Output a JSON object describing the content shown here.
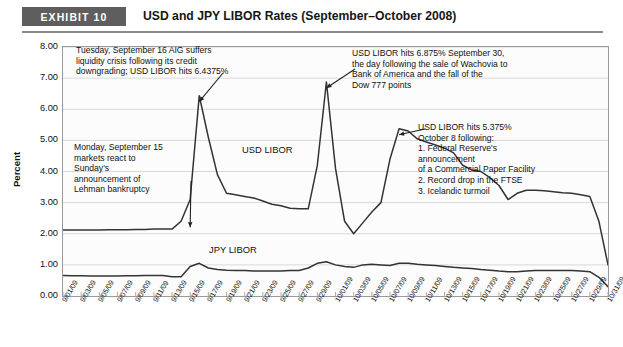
{
  "header": {
    "badge": "EXHIBIT 10",
    "title": "USD and JPY LIBOR Rates (September–October 2008)"
  },
  "chart_data": {
    "type": "line",
    "title": "USD and JPY LIBOR Rates (September–October 2008)",
    "xlabel": "",
    "ylabel": "Percent",
    "ylim": [
      0.0,
      8.0
    ],
    "ytick_labels": [
      "0.00",
      "1.00",
      "2.00",
      "3.00",
      "4.00",
      "5.00",
      "6.00",
      "7.00",
      "8.00"
    ],
    "ytick_values": [
      0,
      1,
      2,
      3,
      4,
      5,
      6,
      7,
      8
    ],
    "grid": true,
    "legend_position": "inline-plot-labels",
    "x": [
      "9/01/09",
      "9/02/09",
      "9/03/09",
      "9/04/09",
      "9/05/09",
      "9/06/09",
      "9/07/09",
      "9/08/09",
      "9/09/09",
      "9/10/09",
      "9/11/09",
      "9/12/09",
      "9/13/09",
      "9/14/09",
      "9/15/09",
      "9/16/09",
      "9/17/09",
      "9/18/09",
      "9/19/09",
      "9/20/09",
      "9/21/09",
      "9/22/09",
      "9/23/09",
      "9/24/09",
      "9/25/09",
      "9/26/09",
      "9/27/09",
      "9/28/09",
      "9/29/09",
      "9/30/09",
      "10/01/09",
      "10/02/09",
      "10/03/09",
      "10/04/09",
      "10/05/09",
      "10/06/09",
      "10/07/09",
      "10/08/09",
      "10/09/09",
      "10/10/09",
      "10/11/09",
      "10/12/09",
      "10/13/09",
      "10/14/09",
      "10/15/09",
      "10/16/09",
      "10/17/09",
      "10/18/09",
      "10/19/09",
      "10/20/09",
      "10/21/09",
      "10/22/09",
      "10/23/09",
      "10/24/09",
      "10/25/09",
      "10/26/09",
      "10/27/09",
      "10/28/09",
      "10/29/09",
      "10/30/09",
      "10/31/09"
    ],
    "xtick_labels": [
      "9/01/09",
      "9/03/09",
      "9/05/09",
      "9/07/09",
      "9/09/09",
      "9/11/09",
      "9/13/09",
      "9/15/09",
      "9/17/09",
      "9/19/09",
      "9/21/09",
      "9/23/09",
      "9/25/09",
      "9/27/09",
      "9/29/09",
      "10/01/09",
      "10/03/09",
      "10/05/09",
      "10/07/09",
      "10/09/09",
      "10/11/09",
      "10/13/09",
      "10/15/09",
      "10/17/09",
      "10/19/09",
      "10/21/09",
      "10/23/09",
      "10/25/09",
      "10/27/09",
      "10/29/09",
      "10/31/09"
    ],
    "series": [
      {
        "name": "USD LIBOR",
        "color": "#333333",
        "values": [
          2.12,
          2.12,
          2.12,
          2.12,
          2.12,
          2.13,
          2.13,
          2.13,
          2.14,
          2.14,
          2.15,
          2.15,
          2.15,
          2.4,
          3.1,
          6.4375,
          5.1,
          3.9,
          3.3,
          3.25,
          3.2,
          3.15,
          3.05,
          2.95,
          2.9,
          2.82,
          2.8,
          2.8,
          4.2,
          6.875,
          4.1,
          2.4,
          2.0,
          2.35,
          2.7,
          3.0,
          4.4,
          5.375,
          5.3,
          5.05,
          4.95,
          4.85,
          4.75,
          4.6,
          4.2,
          4.05,
          4.0,
          3.8,
          3.55,
          3.1,
          3.3,
          3.4,
          3.4,
          3.38,
          3.35,
          3.32,
          3.3,
          3.25,
          3.2,
          2.4,
          1.0
        ]
      },
      {
        "name": "JPY LIBOR",
        "color": "#333333",
        "values": [
          0.66,
          0.65,
          0.65,
          0.64,
          0.64,
          0.64,
          0.64,
          0.65,
          0.65,
          0.66,
          0.66,
          0.66,
          0.62,
          0.62,
          0.95,
          1.05,
          0.9,
          0.85,
          0.83,
          0.82,
          0.82,
          0.8,
          0.8,
          0.8,
          0.8,
          0.82,
          0.82,
          0.9,
          1.05,
          1.1,
          1.0,
          0.95,
          0.92,
          1.0,
          1.02,
          1.0,
          0.98,
          1.05,
          1.05,
          1.02,
          1.0,
          0.98,
          0.95,
          0.92,
          0.9,
          0.88,
          0.85,
          0.83,
          0.8,
          0.78,
          0.78,
          0.8,
          0.82,
          0.82,
          0.82,
          0.82,
          0.82,
          0.8,
          0.78,
          0.6,
          0.3
        ]
      }
    ],
    "annotations": [
      {
        "id": "sept16",
        "text": "Tuesday, September 16 AIG suffers\nliquidity crisis following its credit\ndowngrading; USD LIBOR hits 6.4375%",
        "target_x": "9/16/09",
        "target_y": 6.4375
      },
      {
        "id": "sept15",
        "text": "Monday, September 15\nmarkets react to\nSunday's\nannouncement of\nLehman bankruptcy",
        "target_x": "9/15/09",
        "target_y": 2.4
      },
      {
        "id": "sept30",
        "text": "USD LIBOR hits 6.875% September 30,\nthe day following the sale of Wachovia to\nBank of America and the fall of the\nDow 777 points",
        "target_x": "9/30/09",
        "target_y": 6.875
      },
      {
        "id": "oct8",
        "text": "USD LIBOR hits 5.375%\nOctober 8 following:\n1. Federal Reserve's\n    announcement\n    of a Commercial Paper Facility\n2. Record drop in the FTSE\n3. Icelandic turmoil",
        "target_x": "10/08/09",
        "target_y": 5.375
      }
    ],
    "series_labels": [
      {
        "name": "USD LIBOR"
      },
      {
        "name": "JPY LIBOR"
      }
    ]
  }
}
